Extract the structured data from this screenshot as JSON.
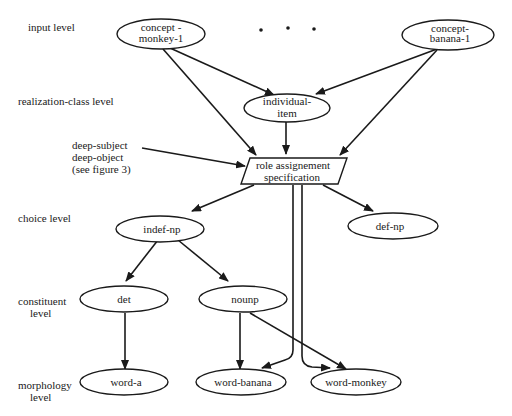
{
  "levels": {
    "input": "input level",
    "realization": "realization-class level",
    "choice": "choice level",
    "constituent_1": "constituent",
    "constituent_2": "level",
    "morphology_1": "morphology",
    "morphology_2": "level"
  },
  "annotation": {
    "line1": "deep-subject",
    "line2": "deep-object",
    "line3": "(see figure 3)"
  },
  "ellipsis": "•   •   •",
  "nodes": {
    "concept_monkey": {
      "line1": "concept -",
      "line2": "monkey-1"
    },
    "concept_banana": {
      "line1": "concept-",
      "line2": "banana-1"
    },
    "individual_item": {
      "line1": "individual-",
      "line2": "item"
    },
    "role_assignment": {
      "line1": "role assignement",
      "line2": "specification"
    },
    "indef_np": "indef-np",
    "def_np": "def-np",
    "det": "det",
    "nounp": "nounp",
    "word_a": "word-a",
    "word_banana": "word-banana",
    "word_monkey": "word-monkey"
  }
}
